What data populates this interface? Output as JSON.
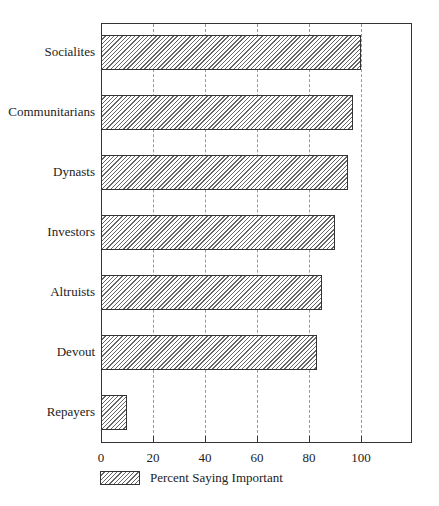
{
  "chart_data": {
    "type": "bar",
    "orientation": "horizontal",
    "title": "",
    "xlabel": "",
    "ylabel": "",
    "categories": [
      "Socialites",
      "Communitarians",
      "Dynasts",
      "Investors",
      "Altruists",
      "Devout",
      "Repayers"
    ],
    "series": [
      {
        "name": "Percent Saying Important",
        "values": [
          100,
          97,
          95,
          90,
          85,
          83,
          10
        ]
      }
    ],
    "xlim": [
      0,
      120
    ],
    "xticks": [
      "0",
      "20",
      "40",
      "60",
      "80",
      "100"
    ],
    "grid": "vertical dashed",
    "legend_position": "bottom-left"
  },
  "legend": {
    "label": "Percent Saying Important"
  }
}
